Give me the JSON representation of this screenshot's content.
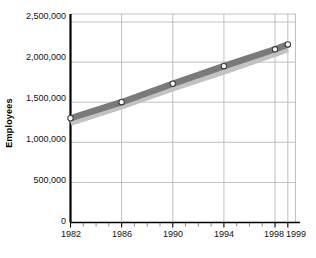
{
  "chart_data": {
    "type": "line",
    "title": "",
    "xlabel": "",
    "ylabel": "Employees",
    "x": [
      1982,
      1986,
      1990,
      1994,
      1998,
      1999
    ],
    "xlim": [
      1982,
      1999.6
    ],
    "ylim": [
      0,
      2600000
    ],
    "grid": true,
    "legend": false,
    "x_tick_labels": [
      "1982",
      "1986",
      "1990",
      "1994",
      "1998",
      "1999"
    ],
    "y_tick_labels": [
      "0",
      "500,000",
      "1,000,000",
      "1,500,000",
      "2,000,000",
      "2,500,000"
    ],
    "y_ticks": [
      0,
      500000,
      1000000,
      1500000,
      2000000,
      2500000
    ],
    "x_minor_ticks": [
      1983,
      1984,
      1985,
      1987,
      1988,
      1989,
      1991,
      1992,
      1993,
      1995,
      1996,
      1997
    ],
    "series": [
      {
        "name": "Employees (upper band)",
        "color": "#7a7a7a",
        "marker": "open-circle",
        "values": [
          1300000,
          1500000,
          1730000,
          1950000,
          2160000,
          2220000
        ]
      },
      {
        "name": "Employees (lower band)",
        "color": "#c2c2c2",
        "marker": "none",
        "values": [
          1245000,
          1450000,
          1675000,
          1885000,
          2105000,
          2165000
        ]
      }
    ],
    "colors": {
      "axis": "#000000",
      "grid": "#b9b9b9",
      "band_dark": "#7a7a7a",
      "band_light": "#c2c2c2",
      "marker_fill": "#ffffff",
      "marker_stroke": "#3d3d3d",
      "background": "#ffffff",
      "text": "#111111"
    }
  }
}
